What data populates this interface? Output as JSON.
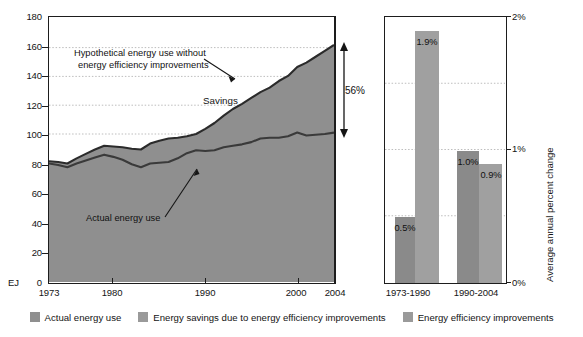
{
  "chart_data": [
    {
      "type": "area",
      "panel": "left",
      "title": "",
      "xlabel": "",
      "ylabel": "EJ",
      "xlim": [
        1973,
        2004
      ],
      "ylim": [
        0,
        180
      ],
      "yticks": [
        0,
        20,
        40,
        60,
        80,
        100,
        120,
        140,
        160,
        180
      ],
      "xticks": [
        1973,
        1980,
        1990,
        2000,
        2004
      ],
      "grid": true,
      "annotations": [
        {
          "name": "hypothetical-label",
          "text_line1": "Hypothetical energy use without",
          "text_line2": "energy efficiency improvements"
        },
        {
          "name": "savings-label",
          "text": "Savings"
        },
        {
          "name": "actual-label",
          "text": "Actual energy use"
        },
        {
          "name": "gap-label",
          "text": "56%"
        }
      ],
      "series": [
        {
          "name": "Actual energy use",
          "color": "#8f8f8f",
          "x": [
            1973,
            1974,
            1975,
            1976,
            1977,
            1978,
            1979,
            1980,
            1981,
            1982,
            1983,
            1984,
            1985,
            1986,
            1987,
            1988,
            1989,
            1990,
            1991,
            1992,
            1993,
            1994,
            1995,
            1996,
            1997,
            1998,
            1999,
            2000,
            2001,
            2002,
            2003,
            2004
          ],
          "values": [
            80.5,
            79.5,
            78.0,
            80.5,
            82.5,
            84.5,
            86.5,
            85.0,
            83.0,
            80.0,
            78.0,
            80.5,
            81.0,
            81.5,
            84.0,
            87.5,
            89.5,
            89.0,
            89.5,
            91.5,
            92.5,
            93.5,
            95.0,
            97.5,
            98.0,
            98.0,
            99.0,
            101.5,
            99.5,
            100.0,
            100.5,
            101.5
          ]
        },
        {
          "name": "Hypothetical energy use without energy efficiency improvements",
          "color": "#ffffff",
          "x": [
            1973,
            1974,
            1975,
            1976,
            1977,
            1978,
            1979,
            1980,
            1981,
            1982,
            1983,
            1984,
            1985,
            1986,
            1987,
            1988,
            1989,
            1990,
            1991,
            1992,
            1993,
            1994,
            1995,
            1996,
            1997,
            1998,
            1999,
            2000,
            2001,
            2002,
            2003,
            2004
          ],
          "values": [
            82.0,
            81.5,
            80.5,
            84.0,
            87.0,
            90.0,
            92.5,
            92.0,
            91.5,
            90.5,
            90.0,
            94.0,
            96.0,
            97.5,
            98.0,
            99.0,
            100.5,
            104.0,
            108.0,
            113.0,
            117.5,
            121.0,
            125.0,
            129.0,
            132.0,
            136.5,
            140.0,
            146.0,
            149.0,
            153.0,
            157.0,
            161.0
          ]
        }
      ],
      "gap_percent": "56%",
      "gap_year": 2004
    },
    {
      "type": "bar",
      "panel": "right",
      "title": "",
      "xlabel": "",
      "ylabel": "Average annual percent change",
      "ylim": [
        0,
        2
      ],
      "yticks": [
        "0%",
        "1%",
        "2%"
      ],
      "minor_gridlines": [
        0.5,
        1.5
      ],
      "categories": [
        "1973-1990",
        "1990-2004"
      ],
      "series": [
        {
          "name": "Actual energy use",
          "color": "#8a8a8a",
          "values": [
            0.5,
            1.0
          ],
          "labels": [
            "0.5%",
            "1.0%"
          ]
        },
        {
          "name": "Energy efficiency improvements",
          "color": "#a0a0a0",
          "values": [
            1.9,
            0.9
          ],
          "labels": [
            "1.9%",
            "0.9%"
          ]
        }
      ]
    }
  ],
  "left": {
    "y_axis_unit": "EJ",
    "yticks": [
      "180",
      "160",
      "140",
      "120",
      "100",
      "80",
      "60",
      "40",
      "20",
      "0"
    ],
    "xticks": [
      "1973",
      "1980",
      "1990",
      "2000",
      "2004"
    ],
    "annot_hypothetical_l1": "Hypothetical energy use without",
    "annot_hypothetical_l2": "energy efficiency improvements",
    "annot_savings": "Savings",
    "annot_actual": "Actual energy use",
    "annot_gap": "56%"
  },
  "right": {
    "yticks": [
      "2%",
      "1%",
      "0%"
    ],
    "xticks": [
      "1973-1990",
      "1990-2004"
    ],
    "axis_title": "Average annual percent change",
    "bar_labels": [
      "0.5%",
      "1.9%",
      "1.0%",
      "0.9%"
    ]
  },
  "legend": {
    "items": [
      {
        "label": "Actual energy use",
        "color": "#8f8f8f"
      },
      {
        "label": "Energy savings due to energy efficiency improvements",
        "color": "#9a9a9a"
      },
      {
        "label": "Energy efficiency improvements",
        "color": "#9a9a9a"
      }
    ]
  },
  "colors": {
    "area_fill": "#8f8f8f",
    "line": "#2e2e2e",
    "axis": "#1d1d1d",
    "grid": "#b8b8b8",
    "bar_dark": "#8a8a8a",
    "bar_light": "#a0a0a0"
  }
}
